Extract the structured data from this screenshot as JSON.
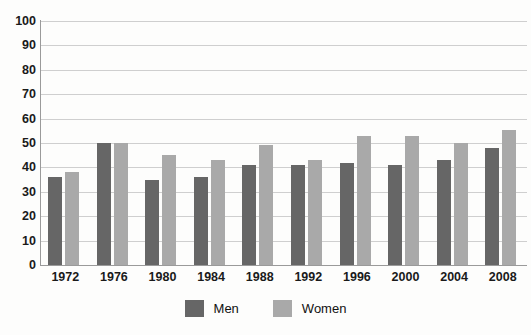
{
  "chart_data": {
    "type": "bar",
    "title": "",
    "subtitle": "",
    "xlabel": "",
    "ylabel": "",
    "categories": [
      "1972",
      "1976",
      "1980",
      "1984",
      "1988",
      "1992",
      "1996",
      "2000",
      "2004",
      "2008"
    ],
    "series": [
      {
        "name": "Men",
        "color": "#666666",
        "values": [
          36,
          50,
          35,
          36,
          41,
          41,
          42,
          41,
          43,
          48
        ]
      },
      {
        "name": "Women",
        "color": "#a9a9a9",
        "values": [
          38,
          50,
          45,
          43,
          49,
          43,
          53,
          53,
          50,
          55.5
        ]
      }
    ],
    "ylim": [
      0,
      100
    ],
    "ytick_step": 10,
    "yticks": [
      "100",
      "90",
      "80",
      "70",
      "60",
      "50",
      "40",
      "30",
      "20",
      "10",
      "0"
    ],
    "grid": true,
    "grid_axis": "y",
    "grid_color": "#cfcfcf",
    "legend_position": "bottom-center",
    "legend": [
      {
        "label": "Men",
        "swatch": "#666666"
      },
      {
        "label": "Women",
        "swatch": "#a9a9a9"
      }
    ],
    "background_color": "#fdfdfc"
  }
}
